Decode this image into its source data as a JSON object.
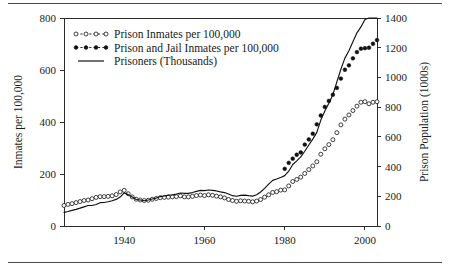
{
  "chart_data": {
    "type": "line",
    "title": "",
    "xlabel": "",
    "ylabel": "Inmates per 100,000",
    "y2label": "Prison Population (1000s)",
    "xlim": [
      1925,
      2003
    ],
    "ylim": [
      0,
      800
    ],
    "y2lim": [
      0,
      1400
    ],
    "grid": false,
    "legend_position": "top-left",
    "xticks": [
      1940,
      1960,
      1980,
      2000
    ],
    "xtick_labels": [
      "1940",
      "1960",
      "1980",
      "2000"
    ],
    "yticks": [
      0,
      200,
      400,
      600,
      800
    ],
    "ytick_labels": [
      "0",
      "200",
      "400",
      "600",
      "800"
    ],
    "y2ticks": [
      0,
      200,
      400,
      600,
      800,
      1000,
      1200,
      1400
    ],
    "y2tick_labels": [
      "0",
      "200",
      "400",
      "600",
      "800",
      "1000",
      "1200",
      "1400"
    ],
    "series": [
      {
        "name": "Prison Inmates per 100,000",
        "axis": "left",
        "style": "open-circle-dashed",
        "x": [
          1925,
          1926,
          1927,
          1928,
          1929,
          1930,
          1931,
          1932,
          1933,
          1934,
          1935,
          1936,
          1937,
          1938,
          1939,
          1940,
          1941,
          1942,
          1943,
          1944,
          1945,
          1946,
          1947,
          1948,
          1949,
          1950,
          1951,
          1952,
          1953,
          1954,
          1955,
          1956,
          1957,
          1958,
          1959,
          1960,
          1961,
          1962,
          1963,
          1964,
          1965,
          1966,
          1967,
          1968,
          1969,
          1970,
          1971,
          1972,
          1973,
          1974,
          1975,
          1976,
          1977,
          1978,
          1979,
          1980,
          1981,
          1982,
          1983,
          1984,
          1985,
          1986,
          1987,
          1988,
          1989,
          1990,
          1991,
          1992,
          1993,
          1994,
          1995,
          1996,
          1997,
          1998,
          1999,
          2000,
          2001,
          2002,
          2003
        ],
        "values": [
          79,
          83,
          86,
          90,
          94,
          98,
          100,
          105,
          110,
          113,
          113,
          114,
          116,
          121,
          131,
          137,
          124,
          112,
          103,
          100,
          98,
          99,
          103,
          106,
          109,
          110,
          111,
          112,
          113,
          116,
          112,
          112,
          114,
          117,
          119,
          117,
          120,
          118,
          115,
          112,
          108,
          102,
          98,
          95,
          97,
          96,
          95,
          93,
          96,
          102,
          111,
          120,
          129,
          132,
          138,
          139,
          154,
          171,
          179,
          188,
          202,
          217,
          231,
          247,
          276,
          297,
          313,
          332,
          359,
          389,
          411,
          427,
          444,
          461,
          476,
          478,
          470,
          476,
          478
        ]
      },
      {
        "name": "Prison and Jail Inmates per 100,000",
        "axis": "left",
        "style": "filled-circle-dashed",
        "x": [
          1980,
          1981,
          1982,
          1983,
          1984,
          1985,
          1986,
          1987,
          1988,
          1989,
          1990,
          1991,
          1992,
          1993,
          1994,
          1995,
          1996,
          1997,
          1998,
          1999,
          2000,
          2001,
          2002,
          2003
        ],
        "values": [
          220,
          243,
          259,
          274,
          283,
          313,
          333,
          355,
          391,
          425,
          458,
          481,
          505,
          531,
          567,
          601,
          618,
          645,
          669,
          682,
          684,
          686,
          701,
          715
        ]
      },
      {
        "name": "Prisoners (Thousands)",
        "axis": "right",
        "style": "solid-line",
        "x": [
          1925,
          1926,
          1927,
          1928,
          1929,
          1930,
          1931,
          1932,
          1933,
          1934,
          1935,
          1936,
          1937,
          1938,
          1939,
          1940,
          1941,
          1942,
          1943,
          1944,
          1945,
          1946,
          1947,
          1948,
          1949,
          1950,
          1951,
          1952,
          1953,
          1954,
          1955,
          1956,
          1957,
          1958,
          1959,
          1960,
          1961,
          1962,
          1963,
          1964,
          1965,
          1966,
          1967,
          1968,
          1969,
          1970,
          1971,
          1972,
          1973,
          1974,
          1975,
          1976,
          1977,
          1978,
          1979,
          1980,
          1981,
          1982,
          1983,
          1984,
          1985,
          1986,
          1987,
          1988,
          1989,
          1990,
          1991,
          1992,
          1993,
          1994,
          1995,
          1996,
          1997,
          1998,
          1999,
          2000,
          2001,
          2002,
          2003
        ],
        "values": [
          92,
          98,
          105,
          112,
          120,
          129,
          138,
          138,
          145,
          157,
          158,
          163,
          170,
          179,
          195,
          223,
          211,
          195,
          178,
          175,
          170,
          175,
          182,
          188,
          198,
          202,
          208,
          210,
          215,
          222,
          220,
          220,
          225,
          233,
          240,
          238,
          242,
          240,
          236,
          230,
          225,
          215,
          204,
          200,
          206,
          208,
          204,
          201,
          210,
          229,
          253,
          282,
          307,
          316,
          327,
          339,
          369,
          414,
          438,
          465,
          503,
          545,
          585,
          630,
          713,
          774,
          826,
          884,
          970,
          1055,
          1130,
          1180,
          1240,
          1300,
          1340,
          1390,
          1400,
          1400,
          1400
        ]
      }
    ],
    "legend_entries": [
      "Prison Inmates per 100,000",
      "Prison and Jail Inmates per 100,000",
      "Prisoners (Thousands)"
    ]
  },
  "colors": {
    "ink": "#111111",
    "axis": "#2b2b2b",
    "background": "#ffffff",
    "rule": "#4a4a4a"
  }
}
